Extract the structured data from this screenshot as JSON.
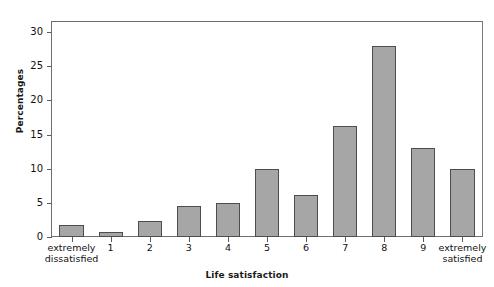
{
  "chart_data": {
    "type": "bar",
    "title": "",
    "xlabel": "Life satisfaction",
    "ylabel": "Percentages",
    "categories": [
      "extremely\ndissatisfied",
      "1",
      "2",
      "3",
      "4",
      "5",
      "6",
      "7",
      "8",
      "9",
      "extremely\nsatisfied"
    ],
    "values": [
      1.7,
      0.8,
      2.3,
      4.6,
      5.0,
      9.9,
      6.1,
      16.3,
      28.0,
      13.1,
      10.0
    ],
    "ylim": [
      0,
      31.5
    ],
    "yticks": [
      0,
      5,
      10,
      15,
      20,
      25,
      30
    ],
    "ytick_labels": [
      "0",
      "5",
      "10",
      "15",
      "20",
      "25",
      "30"
    ],
    "grid": false,
    "legend": false,
    "legend_position": "none",
    "bar_fill_color": "#a6a6a6",
    "bar_border_color": "#4d4d4d",
    "axis_color": "#6e6e6e",
    "background_color": "#ffffff"
  }
}
